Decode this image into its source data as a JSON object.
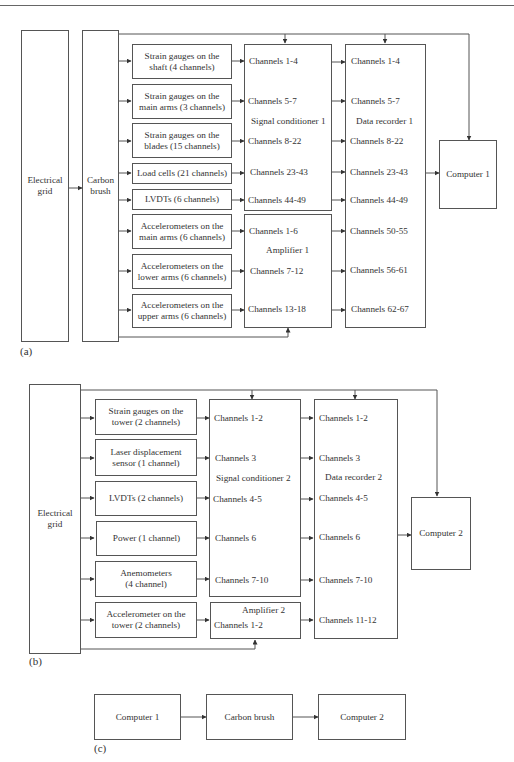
{
  "panel_a": {
    "label": "(a)",
    "electrical_grid": "Electrical\ngrid",
    "carbon_brush": "Carbon\nbrush",
    "sensors": [
      {
        "l1": "Strain gauges on the",
        "l2": "shaft (4 channels)"
      },
      {
        "l1": "Strain gauges on the",
        "l2": "main arms (3 channels)"
      },
      {
        "l1": "Strain gauges on the",
        "l2": "blades (15 channels)"
      },
      {
        "l1": "Load cells (21 channels)",
        "l2": ""
      },
      {
        "l1": "LVDTs (6 channels)",
        "l2": ""
      },
      {
        "l1": "Accelerometers on the",
        "l2": "main arms (6 channels)"
      },
      {
        "l1": "Accelerometers on the",
        "l2": "lower arms (6 channels)"
      },
      {
        "l1": "Accelerometers on the",
        "l2": "upper arms (6 channels)"
      }
    ],
    "signal_conditioner": {
      "title": "Signal conditioner 1",
      "channels": [
        "Channels 1-4",
        "Channels 5-7",
        "Channels 8-22",
        "Channels 23-43",
        "Channels 44-49"
      ]
    },
    "amplifier": {
      "title": "Amplifier 1",
      "channels": [
        "Channels 1-6",
        "Channels 7-12",
        "Channels 13-18"
      ]
    },
    "data_recorder": {
      "title": "Data recorder 1",
      "channels": [
        "Channels 1-4",
        "Channels 5-7",
        "Channels 8-22",
        "Channels 23-43",
        "Channels 44-49",
        "Channels 50-55",
        "Channels 56-61",
        "Channels 62-67"
      ]
    },
    "computer": "Computer 1"
  },
  "panel_b": {
    "label": "(b)",
    "electrical_grid": "Electrical\ngrid",
    "sensors": [
      {
        "l1": "Strain gauges on the",
        "l2": "tower (2 channels)"
      },
      {
        "l1": "Laser displacement",
        "l2": "sensor (1 channel)"
      },
      {
        "l1": "LVDTs (2 channels)",
        "l2": ""
      },
      {
        "l1": "Power (1 channel)",
        "l2": ""
      },
      {
        "l1": "Anemometers",
        "l2": "(4 channel)"
      },
      {
        "l1": "Accelerometer on the",
        "l2": "tower (2 channels)"
      }
    ],
    "signal_conditioner": {
      "title": "Signal conditioner 2",
      "channels": [
        "Channels 1-2",
        "Channels 3",
        "Channels 4-5",
        "Channels 6",
        "Channels 7-10"
      ]
    },
    "amplifier": {
      "title": "Amplifier 2",
      "channels": [
        "Channels 1-2"
      ]
    },
    "data_recorder": {
      "title": "Data recorder 2",
      "channels": [
        "Channels 1-2",
        "Channels 3",
        "Channels 4-5",
        "Channels 6",
        "Channels 7-10",
        "Channels 11-12"
      ]
    },
    "computer": "Computer 2"
  },
  "panel_c": {
    "label": "(c)",
    "boxes": [
      "Computer 1",
      "Carbon brush",
      "Computer 2"
    ]
  }
}
